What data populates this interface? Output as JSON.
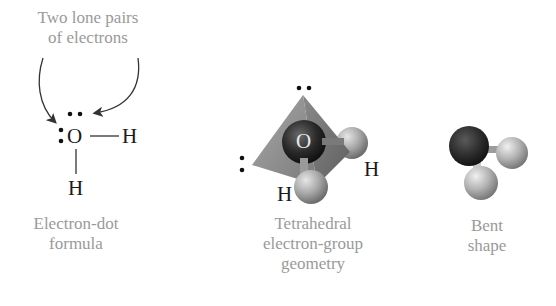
{
  "figure": {
    "panels": [
      {
        "id": "electron-dot",
        "caption_lines": [
          "Electron-dot",
          "formula"
        ],
        "annotation_lines": [
          "Two lone pairs",
          "of electrons"
        ],
        "atoms": {
          "central": "O",
          "right": "H",
          "bottom": "H"
        }
      },
      {
        "id": "tetrahedral",
        "caption_lines": [
          "Tetrahedral",
          "electron-group",
          "geometry"
        ],
        "atoms": {
          "central": "O",
          "right": "H",
          "bottom": "H"
        }
      },
      {
        "id": "bent",
        "caption_lines": [
          "Bent",
          "shape"
        ]
      }
    ]
  },
  "colors": {
    "caption_text": "#9a9a9a",
    "atom_text": "#1a1a1a",
    "tetrahedron_face": "#8c8c8c",
    "oxygen_sphere": "#2e2e2e",
    "hydrogen_sphere": "#b0b0b0"
  }
}
